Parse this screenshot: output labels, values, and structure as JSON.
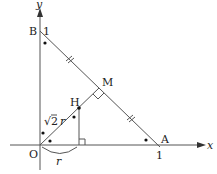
{
  "diagram": {
    "axes": {
      "x_label": "x",
      "y_label": "y",
      "origin_label": "O"
    },
    "points": {
      "O": {
        "label": "O",
        "coord": [
          0,
          0
        ]
      },
      "A": {
        "label": "A",
        "coord": [
          1,
          0
        ]
      },
      "B": {
        "label": "B",
        "coord": [
          0,
          1
        ]
      },
      "M": {
        "label": "M",
        "note": "midpoint of AB"
      },
      "H": {
        "label": "H"
      }
    },
    "ticks": {
      "x_one": "1",
      "y_one": "1"
    },
    "segment_labels": {
      "OH": "√2 r",
      "sqrt": "√",
      "two": "2",
      "r_sym": "r",
      "arc_r": "r"
    },
    "marks": [
      "equal tick marks on BM and MA",
      "right angle at M",
      "right angle at foot of H",
      "angle dots at B, A, and at O"
    ]
  }
}
